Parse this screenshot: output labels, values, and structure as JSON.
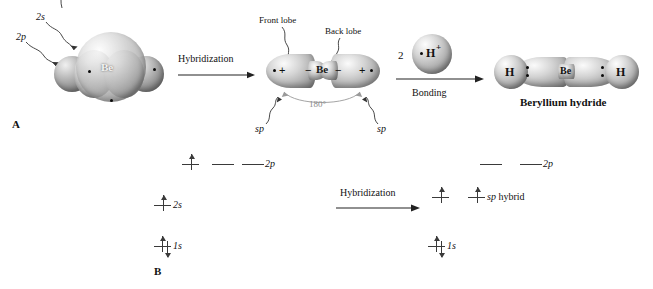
{
  "figure": {
    "panel_a_label": "A",
    "panel_b_label": "B"
  },
  "panel_a": {
    "ground_state": {
      "orbital_labels": [
        {
          "id": "2p",
          "text": "2p"
        },
        {
          "id": "2s",
          "text": "2s"
        }
      ],
      "atom_symbol": "Be"
    },
    "arrow_hybridization": "Hybridization",
    "hybrid_state": {
      "atom_symbol": "Be",
      "callouts": [
        {
          "id": "front-lobe",
          "text": "Front lobe"
        },
        {
          "id": "back-lobe",
          "text": "Back lobe"
        }
      ],
      "lobe_labels": [
        {
          "id": "sp-left",
          "text": "sp"
        },
        {
          "id": "sp-right",
          "text": "sp"
        }
      ],
      "bond_angle": "180°",
      "signs": {
        "outer_left": "+",
        "inner_left": "−",
        "inner_right": "−",
        "outer_right": "+"
      }
    },
    "bonding": {
      "reagent_count": "2",
      "reagent_symbol": "H",
      "reagent_charge": "+",
      "arrow_label": "Bonding"
    },
    "product": {
      "left_atom": "H",
      "center_atom": "Be",
      "right_atom": "H",
      "name": "Beryllium hydride"
    }
  },
  "panel_b": {
    "before": {
      "rows": [
        {
          "id": "2p",
          "label": "2p",
          "boxes": [
            {
              "electrons": [
                "up"
              ]
            },
            {
              "electrons": []
            },
            {
              "electrons": []
            }
          ]
        },
        {
          "id": "2s",
          "label": "2s",
          "boxes": [
            {
              "electrons": [
                "up"
              ]
            }
          ]
        },
        {
          "id": "1s",
          "label": "1s",
          "boxes": [
            {
              "electrons": [
                "up",
                "down"
              ]
            }
          ]
        }
      ]
    },
    "arrow_hybridization": "Hybridization",
    "after": {
      "rows": [
        {
          "id": "2p",
          "label": "2p",
          "boxes": [
            {
              "electrons": []
            },
            {
              "electrons": []
            }
          ]
        },
        {
          "id": "sp",
          "label": "sp hybrid",
          "label_italic_prefix": "sp",
          "label_rest": " hybrid",
          "boxes": [
            {
              "electrons": [
                "up"
              ]
            },
            {
              "electrons": [
                "up"
              ]
            }
          ]
        },
        {
          "id": "1s",
          "label": "1s",
          "boxes": [
            {
              "electrons": [
                "up",
                "down"
              ]
            }
          ]
        }
      ]
    }
  },
  "colors": {
    "ink": "#111111",
    "line": "#3a3a3a",
    "gray_text": "#8b8b8b"
  }
}
